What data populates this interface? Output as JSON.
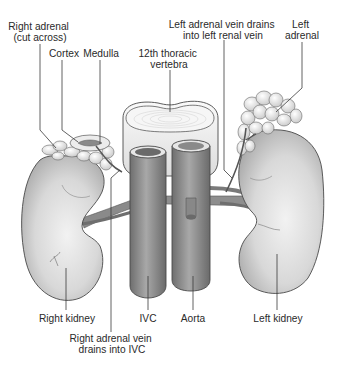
{
  "figure": {
    "colors": {
      "background": "#ffffff",
      "label_text": "#2a2a2a",
      "leader_line": "#3a3a3a",
      "kidney_fill": "#d6d6d6",
      "adrenal_fill": "#e8e8e8",
      "vessel_fill": "#8f8f8f",
      "vertebra_fill": "#f0f0f0"
    }
  },
  "labels": {
    "right_adrenal": {
      "line1": "Right adrenal",
      "line2": "(cut across)"
    },
    "cortex": "Cortex",
    "medulla": "Medulla",
    "vertebra": {
      "line1": "12th thoracic",
      "line2": "vertebra"
    },
    "left_adrenal_vein": {
      "line1": "Left adrenal vein drains",
      "line2": "into left renal vein"
    },
    "left_adrenal": {
      "line1": "Left",
      "line2": "adrenal"
    },
    "right_kidney": "Right kidney",
    "ivc": "IVC",
    "aorta": "Aorta",
    "left_kidney": "Left kidney",
    "right_adrenal_vein": {
      "line1": "Right adrenal vein",
      "line2": "drains into IVC"
    }
  }
}
